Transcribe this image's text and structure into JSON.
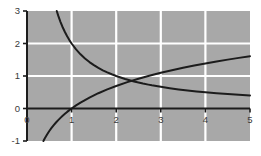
{
  "chart_data": {
    "type": "line",
    "title": "",
    "subtitle": "",
    "xlabel": "",
    "ylabel": "",
    "xlim": [
      0,
      5
    ],
    "ylim": [
      -1,
      3
    ],
    "grid": true,
    "grid_color": "#ffffff",
    "plot_background": "#a8a8a8",
    "figure_background": "#ffffff",
    "axis_color": "#1c1c1c",
    "curve_color": "#1c1c1c",
    "legend": null,
    "legend_position": "none",
    "x_ticks": [
      0,
      1,
      2,
      3,
      4,
      5
    ],
    "x_tick_labels": [
      "0",
      "1",
      "2",
      "3",
      "4",
      "5"
    ],
    "y_ticks": [
      -1,
      0,
      1,
      2,
      3
    ],
    "y_tick_labels": [
      "-1",
      "0",
      "1",
      "2",
      "3"
    ],
    "x_gridlines": [
      1,
      2,
      3,
      4
    ],
    "y_gridlines": [
      1,
      2
    ],
    "annotations": [],
    "intersection": {
      "x": 2.72,
      "y": 1.0
    },
    "series": [
      {
        "name": "y = 2/x",
        "expression": "2/x",
        "color": "#1c1c1c",
        "x": [
          0.667,
          0.7,
          0.75,
          0.8,
          0.85,
          0.9,
          0.95,
          1.0,
          1.1,
          1.2,
          1.3,
          1.4,
          1.5,
          1.6,
          1.7,
          1.8,
          1.9,
          2.0,
          2.2,
          2.4,
          2.6,
          2.72,
          2.8,
          3.0,
          3.2,
          3.4,
          3.6,
          3.8,
          4.0,
          4.25,
          4.5,
          4.75,
          5.0
        ],
        "values": [
          3.0,
          2.857,
          2.667,
          2.5,
          2.353,
          2.222,
          2.105,
          2.0,
          1.818,
          1.667,
          1.538,
          1.429,
          1.333,
          1.25,
          1.176,
          1.111,
          1.053,
          1.0,
          0.909,
          0.833,
          0.769,
          0.735,
          0.714,
          0.667,
          0.625,
          0.588,
          0.556,
          0.526,
          0.5,
          0.471,
          0.444,
          0.421,
          0.4
        ]
      },
      {
        "name": "y = ln(x)",
        "expression": "ln(x)",
        "color": "#1c1c1c",
        "x": [
          0.368,
          0.4,
          0.45,
          0.5,
          0.55,
          0.6,
          0.65,
          0.7,
          0.75,
          0.8,
          0.85,
          0.9,
          0.95,
          1.0,
          1.1,
          1.2,
          1.4,
          1.6,
          1.8,
          2.0,
          2.25,
          2.5,
          2.72,
          3.0,
          3.25,
          3.5,
          3.75,
          4.0,
          4.25,
          4.5,
          4.75,
          5.0
        ],
        "values": [
          -1.0,
          -0.916,
          -0.799,
          -0.693,
          -0.598,
          -0.511,
          -0.431,
          -0.357,
          -0.288,
          -0.223,
          -0.163,
          -0.105,
          -0.051,
          0.0,
          0.095,
          0.182,
          0.336,
          0.47,
          0.588,
          0.693,
          0.811,
          0.916,
          1.001,
          1.099,
          1.179,
          1.253,
          1.322,
          1.386,
          1.447,
          1.504,
          1.558,
          1.609
        ]
      }
    ]
  },
  "geometry": {
    "plot_left": 27,
    "plot_right": 250,
    "plot_top": 11,
    "plot_bottom": 141
  }
}
